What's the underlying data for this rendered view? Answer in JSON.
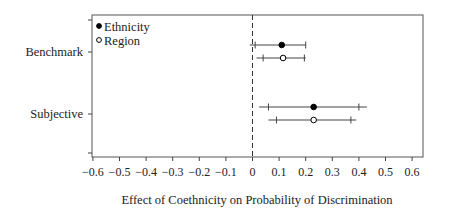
{
  "chart_data": {
    "type": "scatter",
    "subtype": "coefficient-plot-with-confidence-intervals",
    "title": "",
    "xlabel": "Effect of Coethnicity on Probability of Discrimination",
    "ylabel": "",
    "xlim": [
      -0.62,
      0.62
    ],
    "x_ticks": [
      -0.6,
      -0.5,
      -0.4,
      -0.3,
      -0.2,
      -0.1,
      0,
      0.1,
      0.2,
      0.3,
      0.4,
      0.5,
      0.6
    ],
    "x_tick_labels": [
      "−0.6",
      "−0.5",
      "−0.4",
      "−0.3",
      "−0.2",
      "−0.1",
      "0",
      "0.1",
      "0.2",
      "0.3",
      "0.4",
      "0.5",
      "0.6"
    ],
    "categories": [
      "Benchmark",
      "Subjective"
    ],
    "reference_line": {
      "x": 0,
      "style": "dashed"
    },
    "grid": false,
    "legend": {
      "position": "top-left",
      "entries": [
        {
          "label": "Ethnicity",
          "marker": "filled-circle"
        },
        {
          "label": "Region",
          "marker": "open-circle"
        }
      ]
    },
    "series": [
      {
        "name": "Ethnicity",
        "marker": "filled-circle",
        "points": [
          {
            "category": "Benchmark",
            "estimate": 0.11,
            "ci95": [
              -0.01,
              0.2
            ],
            "ci90": [
              0.01,
              0.2
            ]
          },
          {
            "category": "Subjective",
            "estimate": 0.23,
            "ci95": [
              0.025,
              0.43
            ],
            "ci90": [
              0.06,
              0.4
            ]
          }
        ]
      },
      {
        "name": "Region",
        "marker": "open-circle",
        "points": [
          {
            "category": "Benchmark",
            "estimate": 0.115,
            "ci95": [
              0.015,
              0.2
            ],
            "ci90": [
              0.04,
              0.195
            ]
          },
          {
            "category": "Subjective",
            "estimate": 0.23,
            "ci95": [
              0.06,
              0.39
            ],
            "ci90": [
              0.09,
              0.37
            ]
          }
        ]
      }
    ]
  }
}
